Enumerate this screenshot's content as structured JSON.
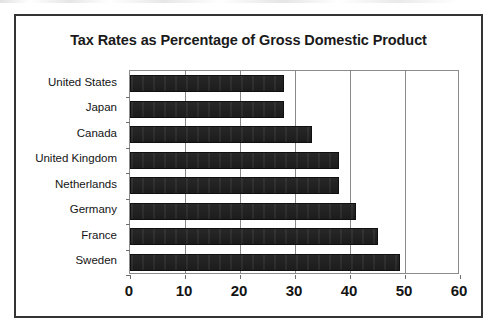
{
  "chart_data": {
    "type": "bar",
    "orientation": "horizontal",
    "title": "Tax Rates as Percentage of Gross Domestic Product",
    "xlabel": "",
    "ylabel": "",
    "categories": [
      "United States",
      "Japan",
      "Canada",
      "United Kingdom",
      "Netherlands",
      "Germany",
      "France",
      "Sweden"
    ],
    "values": [
      28,
      28,
      33,
      38,
      38,
      41,
      45,
      49
    ],
    "xlim": [
      0,
      60
    ],
    "xticks": [
      0,
      10,
      20,
      30,
      40,
      50,
      60
    ],
    "xtick_labels": [
      "0",
      "10",
      "20",
      "30",
      "40",
      "50",
      "60"
    ],
    "grid": "vertical",
    "legend": null,
    "bar_color": "#1c1c1c",
    "plot_border_color": "#8a8a8a",
    "frame_border_color": "#343434"
  }
}
